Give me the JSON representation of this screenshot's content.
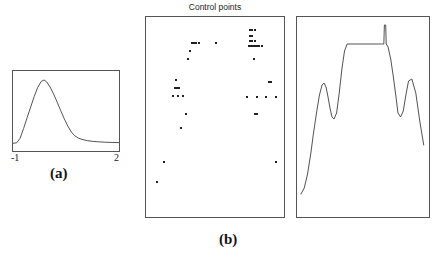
{
  "figure": {
    "width": 438,
    "height": 259,
    "background": "#ffffff",
    "line_color": "#3c3c3c",
    "point_color": "#202020",
    "border_color": "#555555"
  },
  "panel_a": {
    "caption": "(a)",
    "tick_left": "-1",
    "tick_right": "2"
  },
  "panel_b": {
    "caption": "(b)",
    "scatter_title": "Control points"
  },
  "chart_data": [
    {
      "type": "line",
      "name": "panel-a-kernel-curve",
      "title": "",
      "xlabel": "",
      "ylabel": "",
      "xlim": [
        -1,
        2
      ],
      "ylim": [
        0,
        1
      ],
      "grid": false,
      "legend": "none",
      "x": [
        -1.0,
        -0.9,
        -0.8,
        -0.7,
        -0.6,
        -0.5,
        -0.4,
        -0.3,
        -0.2,
        -0.12,
        -0.05,
        0.05,
        0.15,
        0.25,
        0.35,
        0.45,
        0.55,
        0.65,
        0.75,
        0.85,
        0.95,
        1.1,
        1.25,
        1.4,
        1.6,
        1.8,
        2.0
      ],
      "y": [
        0.055,
        0.06,
        0.125,
        0.265,
        0.42,
        0.57,
        0.72,
        0.85,
        0.935,
        0.955,
        0.93,
        0.855,
        0.755,
        0.64,
        0.52,
        0.405,
        0.3,
        0.215,
        0.16,
        0.128,
        0.11,
        0.092,
        0.082,
        0.076,
        0.07,
        0.066,
        0.064
      ]
    },
    {
      "type": "scatter",
      "name": "panel-b-control-points",
      "title": "Control points",
      "xlabel": "",
      "ylabel": "",
      "xlim": [
        0,
        1
      ],
      "ylim": [
        0,
        1
      ],
      "grid": false,
      "legend": "none",
      "points": [
        [
          0.745,
          0.935
        ],
        [
          0.76,
          0.935
        ],
        [
          0.775,
          0.935
        ],
        [
          0.745,
          0.905
        ],
        [
          0.76,
          0.905
        ],
        [
          0.745,
          0.88
        ],
        [
          0.76,
          0.88
        ],
        [
          0.775,
          0.88
        ],
        [
          0.735,
          0.855
        ],
        [
          0.75,
          0.855
        ],
        [
          0.765,
          0.855
        ],
        [
          0.78,
          0.855
        ],
        [
          0.795,
          0.855
        ],
        [
          0.81,
          0.855
        ],
        [
          0.825,
          0.855
        ],
        [
          0.33,
          0.87
        ],
        [
          0.345,
          0.87
        ],
        [
          0.36,
          0.87
        ],
        [
          0.375,
          0.87
        ],
        [
          0.5,
          0.87
        ],
        [
          0.315,
          0.83
        ],
        [
          0.3,
          0.79
        ],
        [
          0.77,
          0.79
        ],
        [
          0.215,
          0.69
        ],
        [
          0.205,
          0.65
        ],
        [
          0.22,
          0.65
        ],
        [
          0.235,
          0.65
        ],
        [
          0.875,
          0.68
        ],
        [
          0.89,
          0.68
        ],
        [
          0.19,
          0.61
        ],
        [
          0.23,
          0.61
        ],
        [
          0.265,
          0.61
        ],
        [
          0.72,
          0.605
        ],
        [
          0.79,
          0.605
        ],
        [
          0.86,
          0.605
        ],
        [
          0.93,
          0.605
        ],
        [
          0.285,
          0.52
        ],
        [
          0.78,
          0.52
        ],
        [
          0.795,
          0.52
        ],
        [
          0.25,
          0.45
        ],
        [
          0.13,
          0.28
        ],
        [
          0.93,
          0.28
        ],
        [
          0.075,
          0.185
        ]
      ]
    },
    {
      "type": "line",
      "name": "panel-b-reconstruction",
      "title": "",
      "xlabel": "",
      "ylabel": "",
      "xlim": [
        0,
        1
      ],
      "ylim": [
        0,
        1
      ],
      "grid": false,
      "legend": "none",
      "x": [
        0.03,
        0.055,
        0.08,
        0.105,
        0.125,
        0.15,
        0.17,
        0.19,
        0.205,
        0.22,
        0.235,
        0.25,
        0.265,
        0.28,
        0.3,
        0.32,
        0.34,
        0.36,
        0.38,
        0.6,
        0.62,
        0.64,
        0.658,
        0.662,
        0.672,
        0.676,
        0.69,
        0.71,
        0.73,
        0.75,
        0.765,
        0.785,
        0.805,
        0.825,
        0.845,
        0.87,
        0.9,
        0.93,
        0.96
      ],
      "y": [
        0.115,
        0.145,
        0.215,
        0.32,
        0.42,
        0.53,
        0.61,
        0.66,
        0.67,
        0.65,
        0.6,
        0.545,
        0.5,
        0.49,
        0.52,
        0.62,
        0.74,
        0.83,
        0.865,
        0.865,
        0.865,
        0.865,
        0.865,
        0.96,
        0.96,
        0.865,
        0.85,
        0.79,
        0.7,
        0.6,
        0.52,
        0.5,
        0.53,
        0.61,
        0.68,
        0.69,
        0.62,
        0.48,
        0.36
      ]
    }
  ]
}
